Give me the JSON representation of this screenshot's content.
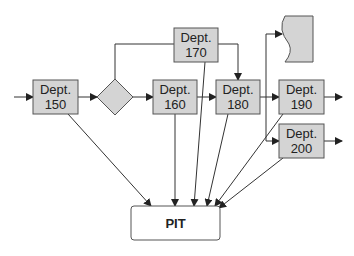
{
  "diagram": {
    "nodes": {
      "dept150": {
        "line1": "Dept.",
        "line2": "150"
      },
      "dept160": {
        "line1": "Dept.",
        "line2": "160"
      },
      "dept170": {
        "line1": "Dept.",
        "line2": "170"
      },
      "dept180": {
        "line1": "Dept.",
        "line2": "180"
      },
      "dept190": {
        "line1": "Dept.",
        "line2": "190"
      },
      "dept200": {
        "line1": "Dept.",
        "line2": "200"
      },
      "pit": {
        "label": "PIT"
      },
      "decision": {
        "label": ""
      },
      "document": {
        "label": ""
      }
    },
    "colors": {
      "box_fill": "#d4d4d4",
      "box_stroke": "#555555",
      "line": "#333333",
      "pit_fill": "#ffffff"
    }
  }
}
